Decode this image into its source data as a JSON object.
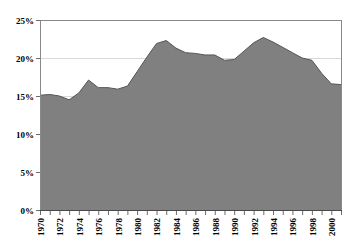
{
  "chart_data": {
    "type": "area",
    "title": "",
    "subtitle": "",
    "xlabel": "",
    "ylabel": "",
    "grid": true,
    "legend_position": "none",
    "xlim": [
      1970,
      2001
    ],
    "ylim": [
      0,
      25
    ],
    "ytick_labels": [
      "0%",
      "5%",
      "10%",
      "15%",
      "20%",
      "25%"
    ],
    "ytick_values": [
      0,
      5,
      10,
      15,
      20,
      25
    ],
    "xtick_labels": [
      "1970",
      "1971",
      "1972",
      "1973",
      "1974",
      "1975",
      "1976",
      "1977",
      "1978",
      "1979",
      "1980",
      "1981",
      "1982",
      "1983",
      "1984",
      "1985",
      "1986",
      "1987",
      "1988",
      "1989",
      "1990",
      "1991",
      "1992",
      "1993",
      "1994",
      "1995",
      "1996",
      "1997",
      "1998",
      "1999",
      "2000",
      "2001"
    ],
    "xtick_labels_shown": [
      "1970",
      "1972",
      "1974",
      "1976",
      "1978",
      "1980",
      "1982",
      "1984",
      "1986",
      "1988",
      "1990",
      "1992",
      "1994",
      "1996",
      "1998",
      "2000"
    ],
    "series": [
      {
        "name": "value",
        "x": [
          1970,
          1971,
          1972,
          1973,
          1974,
          1975,
          1976,
          1977,
          1978,
          1979,
          1980,
          1981,
          1982,
          1983,
          1984,
          1985,
          1986,
          1987,
          1988,
          1989,
          1990,
          1991,
          1992,
          1993,
          1994,
          1995,
          1996,
          1997,
          1998,
          1999,
          2000,
          2001
        ],
        "values": [
          15.1,
          15.2,
          15.0,
          14.5,
          15.4,
          17.1,
          16.1,
          16.1,
          15.9,
          16.3,
          18.2,
          20.1,
          21.9,
          22.3,
          21.3,
          20.7,
          20.6,
          20.4,
          20.4,
          19.7,
          19.8,
          20.9,
          22.0,
          22.7,
          22.1,
          21.4,
          20.7,
          20.0,
          19.7,
          18.0,
          16.6,
          16.5
        ]
      }
    ],
    "fill_color": "#808080",
    "line_color": "#555555",
    "axis_color": "#888888",
    "grid_color": "#d9d9d9",
    "plot_background": "#ffffff"
  },
  "plot_geometry": {
    "left": 40,
    "right": 341,
    "top": 20,
    "bottom": 210
  }
}
